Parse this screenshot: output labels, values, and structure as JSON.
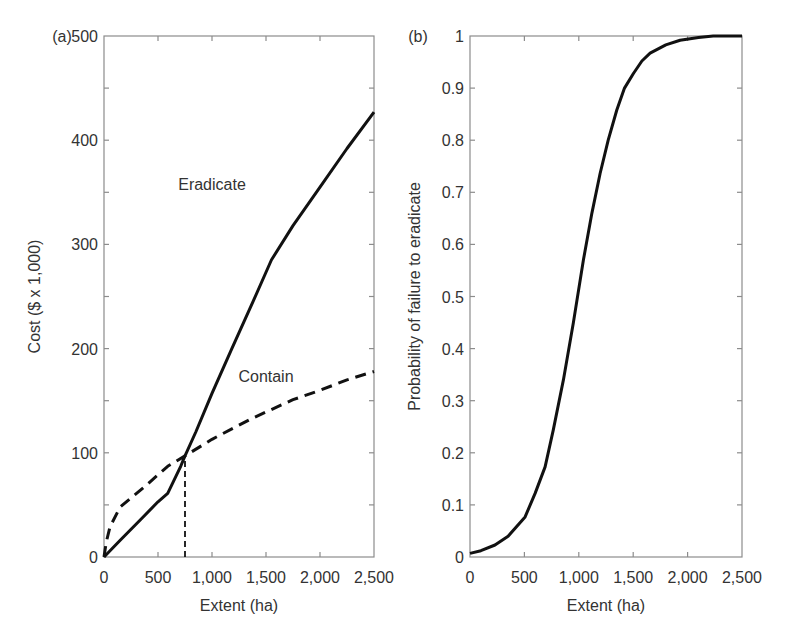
{
  "figure": {
    "background": "#ffffff",
    "frame_color": "#8c8c8c",
    "line_color": "#111111",
    "text_color": "#333333"
  },
  "chart_data": [
    {
      "type": "line",
      "panel_label": "(a)",
      "title": "",
      "xlabel": "Extent (ha)",
      "ylabel": "Cost ($ x 1,000)",
      "xlim": [
        0,
        2500
      ],
      "ylim": [
        0,
        500
      ],
      "xticks": [
        0,
        500,
        1000,
        1500,
        2000,
        2500
      ],
      "xtick_labels": [
        "0",
        "500",
        "1,000",
        "1,500",
        "2,000",
        "2,500"
      ],
      "yticks": [
        0,
        100,
        200,
        300,
        400,
        500
      ],
      "ytick_labels": [
        "0",
        "100",
        "200",
        "300",
        "400",
        "500"
      ],
      "yminor_ticks": [
        50,
        150,
        250,
        350,
        450
      ],
      "grid": false,
      "legend": "none (inline labels)",
      "series": [
        {
          "name": "Eradicate",
          "style": "solid",
          "label_pos": [
            1000,
            352
          ],
          "x": [
            0,
            150,
            340,
            500,
            590,
            710,
            750,
            850,
            1000,
            1180,
            1380,
            1550,
            1750,
            2000,
            2250,
            2500
          ],
          "y": [
            0,
            16,
            36,
            53,
            61,
            87,
            97,
            120,
            157,
            199,
            245,
            285,
            318,
            355,
            392,
            427
          ]
        },
        {
          "name": "Contain",
          "style": "dashed",
          "label_pos": [
            1500,
            168
          ],
          "x": [
            0,
            20,
            56,
            150,
            370,
            590,
            750,
            1000,
            1370,
            1750,
            2000,
            2250,
            2500
          ],
          "y": [
            0,
            14,
            29,
            48,
            67,
            87,
            97,
            113,
            133,
            151,
            160,
            170,
            178
          ]
        },
        {
          "name": "Break-even extent",
          "style": "dashed-vertical",
          "x": [
            750,
            750
          ],
          "y": [
            0,
            97
          ]
        }
      ],
      "annotations": [
        "Eradicate",
        "Contain"
      ]
    },
    {
      "type": "line",
      "panel_label": "(b)",
      "title": "",
      "xlabel": "Extent (ha)",
      "ylabel": "Probability of failure to eradicate",
      "xlim": [
        0,
        2500
      ],
      "ylim": [
        0,
        1
      ],
      "xticks": [
        0,
        500,
        1000,
        1500,
        2000,
        2500
      ],
      "xtick_labels": [
        "0",
        "500",
        "1,000",
        "1,500",
        "2,000",
        "2,500"
      ],
      "yticks": [
        0,
        0.1,
        0.2,
        0.3,
        0.4,
        0.5,
        0.6,
        0.7,
        0.8,
        0.9,
        1
      ],
      "ytick_labels": [
        "0",
        "0.1",
        "0.2",
        "0.3",
        "0.4",
        "0.5",
        "0.6",
        "0.7",
        "0.8",
        "0.9",
        "1"
      ],
      "grid": false,
      "legend": "none",
      "series": [
        {
          "name": "Probability of failure to eradicate",
          "style": "solid",
          "x": [
            0,
            100,
            230,
            350,
            506,
            598,
            690,
            766,
            858,
            950,
            1042,
            1120,
            1196,
            1270,
            1349,
            1420,
            1502,
            1580,
            1655,
            1800,
            1931,
            2100,
            2235,
            2500
          ],
          "y": [
            0.007,
            0.012,
            0.023,
            0.04,
            0.077,
            0.122,
            0.173,
            0.244,
            0.34,
            0.45,
            0.57,
            0.66,
            0.736,
            0.8,
            0.858,
            0.9,
            0.928,
            0.952,
            0.967,
            0.983,
            0.992,
            0.997,
            1.0,
            1.0
          ]
        }
      ]
    }
  ],
  "layout": {
    "panels": [
      {
        "left": 104,
        "top": 36,
        "right": 374,
        "bottom": 557,
        "ylabel_x": 40,
        "panel_label_x": 62
      },
      {
        "left": 470,
        "top": 36,
        "right": 742,
        "bottom": 557,
        "ylabel_x": 420,
        "panel_label_x": 418
      }
    ]
  }
}
